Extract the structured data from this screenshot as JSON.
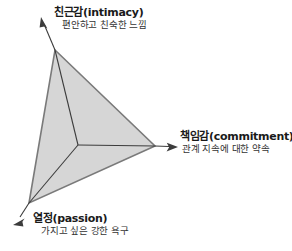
{
  "diagram": {
    "type": "triangle-concept-diagram",
    "fill_color": "#d6d6d6",
    "stroke_color": "#6b6b6b",
    "inner_line_color": "#3c3c3c",
    "arrow_color": "#3c3c3c",
    "background_color": "#ffffff",
    "vertices": [
      {
        "id": "intimacy",
        "title": "친근감(intimacy)",
        "subtitle": "편안하고 친숙한 느낌",
        "position": "top",
        "point": [
          55,
          50
        ],
        "arrow_tip": [
          41,
          18
        ]
      },
      {
        "id": "commitment",
        "title": "책임감(commitment)",
        "subtitle": "관계 지속에 대한 약속",
        "position": "right",
        "point": [
          155,
          146
        ],
        "arrow_tip": [
          177,
          147
        ]
      },
      {
        "id": "passion",
        "title": "열정(passion)",
        "subtitle": "가지고 싶은 강한 욕구",
        "position": "bottom-left",
        "point": [
          29,
          203
        ],
        "arrow_tip": [
          14,
          224
        ]
      }
    ],
    "center_point": [
      78,
      145
    ]
  }
}
